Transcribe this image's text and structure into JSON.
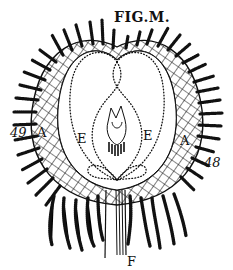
{
  "figure": {
    "title": "FIG.M.",
    "labels": {
      "left_number": "49",
      "right_number": "48",
      "left_region": "A",
      "right_region": "A",
      "left_chamber": "E",
      "right_chamber": "E",
      "stem": "F"
    },
    "colors": {
      "ink": "#111111",
      "paper": "#ffffff"
    }
  }
}
